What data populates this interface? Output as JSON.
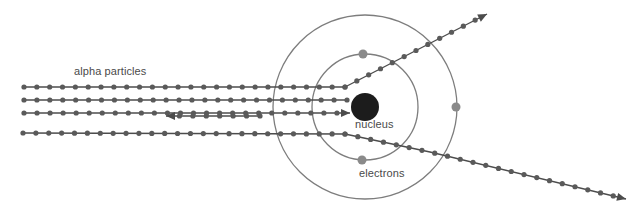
{
  "figure": {
    "background_color": "#ffffff",
    "width": 629,
    "height": 214,
    "labels": {
      "alpha_particles": "alpha particles",
      "nucleus": "nucleus",
      "electrons": "electrons"
    },
    "colors": {
      "track_line": "#4c4c4c",
      "track_dot": "#5a5a5a",
      "orbit_line": "#7d7d7d",
      "electron_dot": "#8a8a8a",
      "nucleus_fill": "#1c1c1c",
      "label_text": "#4a4a4a"
    }
  },
  "chart_data": {
    "type": "scatter",
    "xlabel": "",
    "ylabel": "",
    "xlim": [
      0,
      629
    ],
    "ylim": [
      214,
      0
    ],
    "grid": false,
    "legend": "none",
    "annotations": [
      {
        "name": "alpha-particles-label",
        "text": "alpha particles",
        "x": 74,
        "y": 71
      },
      {
        "name": "nucleus-label",
        "text": "nucleus",
        "x": 355,
        "y": 126
      },
      {
        "name": "electrons-label",
        "text": "electrons",
        "x": 359,
        "y": 175
      }
    ],
    "atom": {
      "center": [
        365,
        107
      ],
      "nucleus_radius": 14,
      "orbits": [
        {
          "name": "inner-electron-shell",
          "radius": 53
        },
        {
          "name": "outer-electron-shell",
          "radius": 92
        }
      ],
      "electrons": [
        {
          "name": "electron-inner-top",
          "x": 363,
          "y": 54,
          "r": 4.5
        },
        {
          "name": "electron-inner-bottom",
          "x": 362,
          "y": 160,
          "r": 4.5
        },
        {
          "name": "electron-outer-right",
          "x": 456,
          "y": 107,
          "r": 4.5
        }
      ]
    },
    "series": [
      {
        "name": "undeflected-beam-top",
        "kind": "particle-track",
        "arrow": "none",
        "dot_spacing": 13,
        "path": [
          [
            24,
            87
          ],
          [
            345,
            87
          ]
        ]
      },
      {
        "name": "deflected-beam-upper-right",
        "kind": "particle-track",
        "arrow": "end",
        "dot_spacing": 13,
        "path": [
          [
            345,
            87
          ],
          [
            487,
            14
          ]
        ]
      },
      {
        "name": "undeflected-beam-second",
        "kind": "particle-track",
        "arrow": "none",
        "dot_spacing": 13,
        "path": [
          [
            24,
            100
          ],
          [
            347,
            100
          ]
        ]
      },
      {
        "name": "backscattered-beam-incoming",
        "kind": "particle-track",
        "arrow": "end",
        "dot_spacing": 13,
        "path": [
          [
            24,
            113
          ],
          [
            350,
            113
          ]
        ]
      },
      {
        "name": "backscattered-beam-return",
        "kind": "particle-track",
        "arrow": "end",
        "dot_spacing": 13,
        "path": [
          [
            260,
            116
          ],
          [
            166,
            116
          ]
        ]
      },
      {
        "name": "beam-bottom-incoming",
        "kind": "particle-track",
        "arrow": "none",
        "dot_spacing": 13,
        "path": [
          [
            23,
            133
          ],
          [
            345,
            134
          ]
        ]
      },
      {
        "name": "deflected-beam-lower-right",
        "kind": "particle-track",
        "arrow": "end",
        "dot_spacing": 13,
        "path": [
          [
            345,
            134
          ],
          [
            430,
            152
          ],
          [
            626,
            199
          ]
        ]
      }
    ]
  }
}
